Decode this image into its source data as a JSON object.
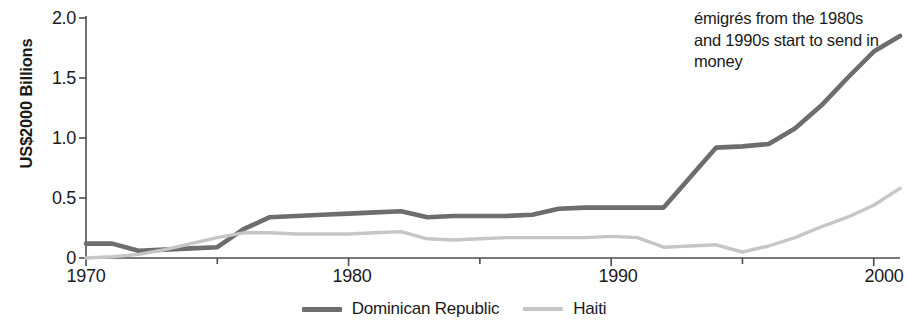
{
  "chart_data": {
    "type": "line",
    "title": "",
    "xlabel": "",
    "ylabel": "US$2000 Billions",
    "xlim": [
      1970,
      2001
    ],
    "ylim": [
      0,
      2.0
    ],
    "grid": false,
    "legend_position": "bottom-center",
    "y_ticks": [
      "0",
      "0.5",
      "1.0",
      "1.5",
      "2.0"
    ],
    "y_tick_values": [
      0,
      0.5,
      1.0,
      1.5,
      2.0
    ],
    "x_ticks": [
      "1970",
      "1980",
      "1990",
      "2000"
    ],
    "x_tick_values": [
      1970,
      1980,
      1990,
      2000
    ],
    "x_minor_tick_values": [
      1975,
      1985,
      1995
    ],
    "x": [
      1970,
      1971,
      1972,
      1973,
      1974,
      1975,
      1976,
      1977,
      1978,
      1979,
      1980,
      1981,
      1982,
      1983,
      1984,
      1985,
      1986,
      1987,
      1988,
      1989,
      1990,
      1991,
      1992,
      1993,
      1994,
      1995,
      1996,
      1997,
      1998,
      1999,
      2000,
      2001
    ],
    "series": [
      {
        "name": "Dominican Republic",
        "color": "#6d6d6d",
        "values": [
          0.12,
          0.12,
          0.06,
          0.07,
          0.08,
          0.09,
          0.24,
          0.34,
          0.35,
          0.36,
          0.37,
          0.38,
          0.39,
          0.34,
          0.35,
          0.35,
          0.35,
          0.36,
          0.41,
          0.42,
          0.42,
          0.42,
          0.42,
          0.67,
          0.92,
          0.93,
          0.95,
          1.08,
          1.27,
          1.5,
          1.72,
          1.85
        ]
      },
      {
        "name": "Haiti",
        "color": "#c6c6c6",
        "values": [
          0.0,
          0.01,
          0.03,
          0.07,
          0.12,
          0.17,
          0.21,
          0.21,
          0.2,
          0.2,
          0.2,
          0.21,
          0.22,
          0.16,
          0.15,
          0.16,
          0.17,
          0.17,
          0.17,
          0.17,
          0.18,
          0.17,
          0.09,
          0.1,
          0.11,
          0.05,
          0.1,
          0.17,
          0.26,
          0.34,
          0.44,
          0.58
        ]
      }
    ],
    "annotations": [
      {
        "name": "emigres-note",
        "text": "émigrés from the 1980s and 1990s start to send in money"
      }
    ]
  },
  "legend": {
    "items": [
      {
        "label": "Dominican Republic",
        "color": "#6d6d6d"
      },
      {
        "label": "Haiti",
        "color": "#c6c6c6"
      }
    ]
  },
  "axes": {
    "y_label": "US$2000 Billions",
    "y_tick_0": "0",
    "y_tick_1": "0.5",
    "y_tick_2": "1.0",
    "y_tick_3": "1.5",
    "y_tick_4": "2.0",
    "x_tick_0": "1970",
    "x_tick_1": "1980",
    "x_tick_2": "1990",
    "x_tick_3": "2000"
  },
  "annotation": {
    "text": "émigrés from the 1980s and 1990s start to send in money"
  }
}
